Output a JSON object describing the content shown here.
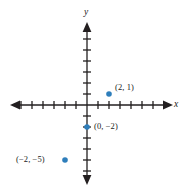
{
  "figure": {
    "type": "coordinate-plane",
    "background_color": "#ffffff",
    "axis_color": "#231f20",
    "point_color": "#2e7ebb",
    "label_color": "#1a1a1a"
  },
  "axes": {
    "x_axis_label": "x",
    "y_axis_label": "y",
    "origin_px": {
      "x": 87,
      "y": 105
    },
    "unit_px": 11,
    "x_range": [
      -7,
      7
    ],
    "y_range": [
      -7,
      5
    ],
    "x_ticks_left": 7,
    "x_ticks_right": 6,
    "y_ticks_up": 5,
    "y_ticks_down": 6,
    "tick_half_length_px": 4,
    "arrowheads": [
      "left",
      "right",
      "up",
      "down"
    ],
    "grid": "none",
    "tick_labels": "none"
  },
  "points": [
    {
      "name": "point-2-1",
      "label": "(2, 1)",
      "x": 2,
      "y": 1,
      "label_position": "right",
      "marker": "filled-circle",
      "color": "#2e7ebb"
    },
    {
      "name": "point-0-neg2",
      "label": "(0, −2)",
      "x": 0,
      "y": -2,
      "label_position": "right",
      "marker": "filled-circle",
      "color": "#2e7ebb"
    },
    {
      "name": "point-neg2-neg5",
      "label": "(−2, −5)",
      "x": -2,
      "y": -5,
      "label_position": "left",
      "marker": "filled-circle",
      "color": "#2e7ebb"
    }
  ]
}
